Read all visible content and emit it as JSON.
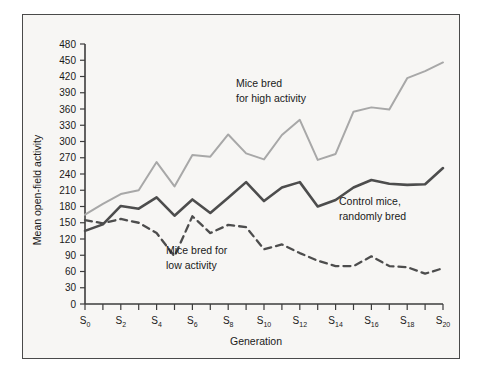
{
  "chart_data": {
    "type": "line",
    "title": "",
    "xlabel": "Generation",
    "ylabel": "Mean open-field activity",
    "xlim": [
      0,
      20
    ],
    "ylim": [
      0,
      480
    ],
    "grid": false,
    "legend_position": "inline-annotations",
    "x": [
      0,
      1,
      2,
      3,
      4,
      5,
      6,
      7,
      8,
      9,
      10,
      11,
      12,
      13,
      14,
      15,
      16,
      17,
      18,
      19,
      20
    ],
    "xtick_labels": [
      "S0",
      "S1",
      "S2",
      "S3",
      "S4",
      "S5",
      "S6",
      "S7",
      "S8",
      "S9",
      "S10",
      "S11",
      "S12",
      "S13",
      "S14",
      "S15",
      "S16",
      "S17",
      "S18",
      "S19",
      "S20"
    ],
    "xtick_labels_visible": [
      "S0",
      "",
      "S2",
      "",
      "S4",
      "",
      "S6",
      "",
      "S8",
      "",
      "S10",
      "",
      "S12",
      "",
      "S14",
      "",
      "S16",
      "",
      "S18",
      "",
      "S20"
    ],
    "xtick_bases": [
      "S",
      "S",
      "S",
      "S",
      "S",
      "S",
      "S",
      "S",
      "S",
      "S",
      "S",
      "S",
      "S",
      "S",
      "S",
      "S",
      "S",
      "S",
      "S",
      "S",
      "S"
    ],
    "xtick_subs": [
      "0",
      "",
      "2",
      "",
      "4",
      "",
      "6",
      "",
      "8",
      "",
      "10",
      "",
      "12",
      "",
      "14",
      "",
      "16",
      "",
      "18",
      "",
      "20"
    ],
    "ytick_labels": [
      "0",
      "30",
      "60",
      "90",
      "120",
      "150",
      "180",
      "210",
      "240",
      "270",
      "300",
      "330",
      "360",
      "390",
      "420",
      "450",
      "480"
    ],
    "ytick_values": [
      0,
      30,
      60,
      90,
      120,
      150,
      180,
      210,
      240,
      270,
      300,
      330,
      360,
      390,
      420,
      450,
      480
    ],
    "series": [
      {
        "name": "Mice bred for high activity",
        "style": "solid-light",
        "color": "#a8a8a8",
        "values": [
          165,
          185,
          203,
          210,
          262,
          217,
          275,
          272,
          313,
          278,
          267,
          312,
          340,
          266,
          277,
          355,
          363,
          359,
          417,
          430,
          446
        ]
      },
      {
        "name": "Control mice, randomly bred",
        "style": "solid-dark",
        "color": "#4d4d4d",
        "values": [
          135,
          147,
          181,
          176,
          197,
          163,
          193,
          168,
          196,
          225,
          190,
          215,
          225,
          180,
          192,
          215,
          229,
          222,
          220,
          221,
          251
        ]
      },
      {
        "name": "Mice bred for low activity",
        "style": "dashed-dark",
        "color": "#4d4d4d",
        "values": [
          155,
          149,
          157,
          150,
          131,
          88,
          162,
          131,
          146,
          142,
          101,
          110,
          94,
          80,
          70,
          70,
          88,
          70,
          68,
          56,
          66
        ]
      }
    ],
    "annotations": [
      {
        "id": "high",
        "line1": "Mice bred",
        "line2": "for high activity"
      },
      {
        "id": "control",
        "line1": "Control mice,",
        "line2": "randomly bred"
      },
      {
        "id": "low",
        "line1": "Mice bred for",
        "line2": "low activity"
      }
    ],
    "colors": {
      "high": "#a8a8a8",
      "control": "#4d4d4d",
      "low": "#4d4d4d",
      "axis": "#3d3d3d",
      "background": "#f7f6f4",
      "frame": "#4a4a4a"
    }
  }
}
